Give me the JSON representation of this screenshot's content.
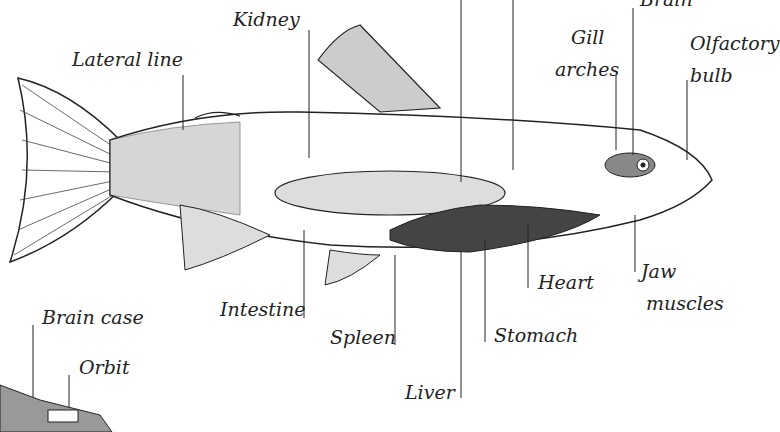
{
  "diagram": {
    "labels": {
      "kidney": "Kidney",
      "brain": "Brain",
      "gill_line1": "Gill",
      "gill_line2": "arches",
      "olf_line1": "Olfactory",
      "olf_line2": "bulb",
      "lateral_line": "Lateral line",
      "heart": "Heart",
      "jaw_line1": "Jaw",
      "jaw_line2": "muscles",
      "intestine": "Intestine",
      "spleen": "Spleen",
      "stomach": "Stomach",
      "liver": "Liver",
      "brain_case": "Brain case",
      "orbit": "Orbit"
    },
    "colors": {
      "ink": "#222222",
      "organ": "#444444",
      "bladder": "#dddddd"
    }
  }
}
